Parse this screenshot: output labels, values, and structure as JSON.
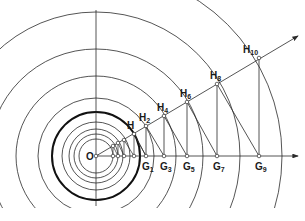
{
  "diagram": {
    "origin": {
      "label": "O",
      "x": 96,
      "y": 156
    },
    "colors": {
      "line": "#2a2a2a",
      "thick": "#111111",
      "background": "#ffffff"
    },
    "circle_radii": [
      17,
      22,
      27,
      34,
      44,
      58,
      80,
      107,
      144,
      186
    ],
    "thick_circle_radius": 44,
    "ray_end": {
      "x": 298,
      "y": 36
    },
    "axis_end": {
      "x": 298,
      "y": 156
    },
    "vertical_axis": {
      "top": 10,
      "bottom": 206
    },
    "h_points": [
      {
        "label": "H",
        "sub": "",
        "x": 134,
        "y": 134
      },
      {
        "label": "H",
        "sub": "2",
        "x": 146,
        "y": 126
      },
      {
        "label": "H",
        "sub": "4",
        "x": 164,
        "y": 116
      },
      {
        "label": "H",
        "sub": "6",
        "x": 187,
        "y": 102
      },
      {
        "label": "H",
        "sub": "8",
        "x": 217,
        "y": 84
      },
      {
        "label": "H",
        "sub": "10",
        "x": 259,
        "y": 58
      }
    ],
    "g_points": [
      {
        "label": "G",
        "sub": "1",
        "x": 146
      },
      {
        "label": "G",
        "sub": "3",
        "x": 164
      },
      {
        "label": "G",
        "sub": "5",
        "x": 187
      },
      {
        "label": "G",
        "sub": "7",
        "x": 217
      },
      {
        "label": "G",
        "sub": "9",
        "x": 259
      }
    ],
    "inner_axis_points": [
      113,
      118,
      124,
      134
    ],
    "inner_ray_points": [
      {
        "x": 113,
        "y": 146
      },
      {
        "x": 118,
        "y": 143
      },
      {
        "x": 124,
        "y": 140
      }
    ]
  }
}
